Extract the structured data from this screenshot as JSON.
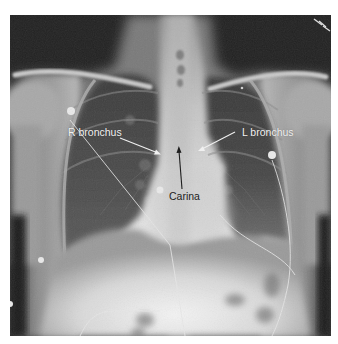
{
  "figure": {
    "type": "chest-radiograph",
    "view": "frontal",
    "annotations": [
      {
        "id": "r-bronchus",
        "label": "R bronchus",
        "color": "#f2f2f2",
        "arrow_color": "#f0f0f0"
      },
      {
        "id": "l-bronchus",
        "label": "L bronchus",
        "color": "#f2f2f2",
        "arrow_color": "#f0f0f0"
      },
      {
        "id": "carina",
        "label": "Carina",
        "color": "#1e1e1e",
        "arrow_color": "#1e1e1e"
      }
    ]
  }
}
